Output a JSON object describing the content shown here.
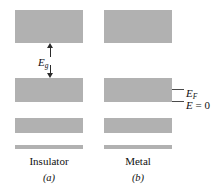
{
  "figure": {
    "background_color": "#ffffff",
    "band_color": "#b1b1b1",
    "line_color": "#2b2b2b"
  },
  "annotations": {
    "gap_symbol": "E",
    "gap_subscript": "g",
    "fermi_symbol": "E",
    "fermi_subscript": "F",
    "zero_symbol": "E",
    "zero_rest": " = 0"
  },
  "panels": [
    {
      "id": "a",
      "caption": "Insulator",
      "letter": "(a)",
      "bands": [
        {
          "name": "conduction-band",
          "x": 15,
          "y": 10,
          "w": 68,
          "h": 33
        },
        {
          "name": "valence-band",
          "x": 15,
          "y": 78,
          "w": 68,
          "h": 24
        },
        {
          "name": "lower-band",
          "x": 15,
          "y": 118,
          "w": 68,
          "h": 15
        }
      ],
      "baseline": {
        "x": 15,
        "y": 145,
        "w": 68,
        "h": 4
      }
    },
    {
      "id": "b",
      "caption": "Metal",
      "letter": "(b)",
      "bands": [
        {
          "name": "upper-band",
          "x": 104,
          "y": 10,
          "w": 68,
          "h": 33
        },
        {
          "name": "partially-filled-band",
          "x": 104,
          "y": 78,
          "w": 68,
          "h": 24
        },
        {
          "name": "lower-band",
          "x": 104,
          "y": 118,
          "w": 68,
          "h": 15
        }
      ],
      "baseline": {
        "x": 104,
        "y": 145,
        "w": 68,
        "h": 4
      }
    }
  ]
}
